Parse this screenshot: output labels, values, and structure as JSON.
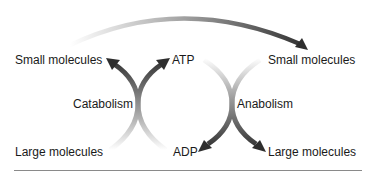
{
  "diagram": {
    "labels": {
      "top_left": "Small molecules",
      "top_center": "ATP",
      "top_right": "Small molecules",
      "middle_left": "Catabolism",
      "middle_right": "Anabolism",
      "bottom_left": "Large molecules",
      "bottom_center": "ADP",
      "bottom_right": "Large molecules"
    },
    "colors": {
      "arrow_dark": "#2e2e2e",
      "arrow_fade": "#e6e6e6",
      "text": "#1a1a1a",
      "rule": "#8a8a8a"
    }
  }
}
